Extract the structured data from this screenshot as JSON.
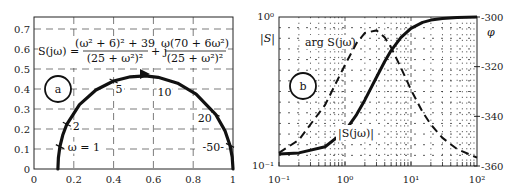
{
  "chart_data": [
    {
      "type": "line",
      "panel_label": "a",
      "title": "",
      "formula": {
        "lhs": "S(jω) =",
        "real_num": "(ω² + 6)² + 39",
        "real_den": "(25 + ω²)²",
        "plus_j": "+ j",
        "imag_num": "ω(70 + 6ω²)",
        "imag_den": "(25 + ω²)²"
      },
      "xlabel": "",
      "ylabel": "",
      "xlim": [
        0,
        1
      ],
      "ylim": [
        0,
        0.75
      ],
      "x_ticks": [
        "0",
        "0.2",
        "0.4",
        "0.6",
        "0.8",
        "1"
      ],
      "y_ticks": [
        "0",
        "0.1",
        "0.2",
        "0.3",
        "0.4",
        "0.5",
        "0.6",
        "0.7"
      ],
      "grid": "dashed",
      "series": [
        {
          "name": "S(jω) Nyquist locus",
          "x": [
            0.12,
            0.1224,
            0.13,
            0.1442,
            0.165,
            0.2284,
            0.3111,
            0.4,
            0.4846,
            0.5595,
            0.6235,
            0.7216,
            0.8148,
            0.9128,
            0.9594,
            0.985,
            0.9962,
            1.0
          ],
          "y": [
            0.0,
            0.0561,
            0.112,
            0.1687,
            0.2235,
            0.3218,
            0.395,
            0.44,
            0.4612,
            0.4653,
            0.4585,
            0.4288,
            0.3744,
            0.2735,
            0.1918,
            0.118,
            0.0598,
            0.0
          ]
        }
      ],
      "annotations": [
        {
          "text": "ω = 1",
          "x": 0.13,
          "y": 0.112
        },
        {
          "text": "2",
          "x": 0.165,
          "y": 0.2235
        },
        {
          "text": "5",
          "x": 0.4,
          "y": 0.44
        },
        {
          "text": "10",
          "x": 0.7216,
          "y": 0.4288
        },
        {
          "text": "20",
          "x": 0.9128,
          "y": 0.2735
        },
        {
          "text": "50",
          "x": 0.985,
          "y": 0.118
        }
      ]
    },
    {
      "type": "line",
      "panel_label": "b",
      "title": "",
      "xscale": "log",
      "xlim": [
        0.1,
        100
      ],
      "x_ticks": [
        "10⁻¹",
        "10⁰",
        "10¹",
        "10²"
      ],
      "left_axis": {
        "label": "|S|",
        "scale": "log",
        "lim": [
          0.1,
          1
        ],
        "ticks": [
          "10⁻¹",
          "10⁰"
        ]
      },
      "right_axis": {
        "label": "φ",
        "lim": [
          -360,
          -300
        ],
        "ticks": [
          "-300",
          "-320",
          "-340",
          "-360"
        ]
      },
      "grid": "dotted",
      "series": [
        {
          "name": "|S(jω)|",
          "style": "solid",
          "axis": "left",
          "omega": [
            0.1,
            0.2,
            0.5,
            1,
            1.5,
            2,
            3,
            4,
            5,
            7,
            10,
            15,
            20,
            30,
            50,
            100
          ],
          "values": [
            0.1206,
            0.1225,
            0.1346,
            0.1715,
            0.2214,
            0.2778,
            0.3946,
            0.5031,
            0.5946,
            0.7277,
            0.8394,
            0.9199,
            0.9529,
            0.9783,
            0.992,
            0.998
          ]
        },
        {
          "name": "arg S(jω)",
          "style": "dashed",
          "axis": "right",
          "omega": [
            0.1,
            0.2,
            0.5,
            1,
            1.5,
            2,
            3,
            4,
            5,
            7,
            10,
            15,
            20,
            30,
            50,
            100
          ],
          "values": [
            -354.7,
            -349.5,
            -335.4,
            -319.3,
            -310.5,
            -306.4,
            -305.4,
            -308.2,
            -312.3,
            -320.3,
            -329.3,
            -338.3,
            -343.3,
            -348.7,
            -353.2,
            -356.6
          ]
        }
      ]
    }
  ],
  "labels": {
    "panel_a": "a",
    "panel_b": "b",
    "left_ylabel": "|S|",
    "right_ylabel": "φ",
    "arg_label": "arg S(jω)",
    "mag_label": "|S(jω)|"
  }
}
